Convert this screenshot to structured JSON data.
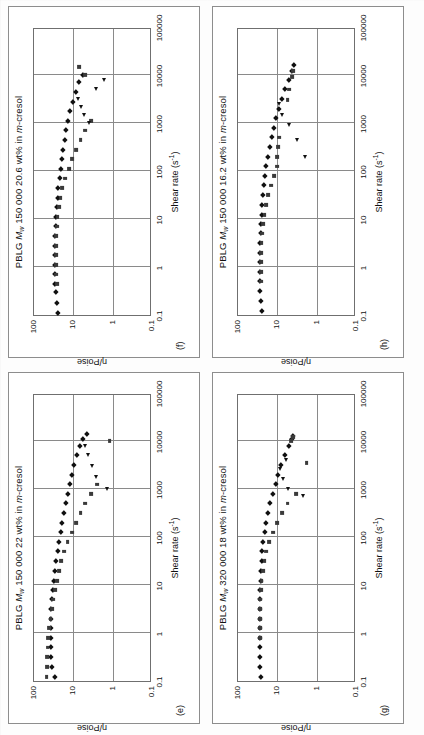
{
  "figure": {
    "axis_x_label": "Shear rate (s",
    "axis_x_label_sup": "-1",
    "axis_x_label_tail": ")",
    "axis_y_label": "η/Poise",
    "x_ticks": [
      "0.1",
      "1",
      "10",
      "100",
      "1000",
      "10000",
      "100000"
    ],
    "y_ticks": [
      "100",
      "10",
      "1",
      "0.1"
    ],
    "series_names": [
      "diamond",
      "square",
      "triangle"
    ],
    "marker_colors": {
      "diamond": "#101010",
      "square": "#3a3a3a",
      "triangle": "#111111"
    },
    "axis_color": "#6f6f6f",
    "grid_color": "#8a8a8a"
  },
  "chart_data": [
    {
      "type": "scatter",
      "panel_letter": "(e)",
      "title_prefix": "PBLG ",
      "title_m": "M",
      "title_m_sub": "w",
      "title_mid": " 150 000 22 wt% in ",
      "title_italic": "m",
      "title_tail": "-cresol",
      "title": "PBLG Mw 150 000 22 wt% in m-cresol",
      "xlabel": "Shear rate (s-1)",
      "ylabel": "η/Poise",
      "xlim": [
        0.1,
        100000
      ],
      "ylim": [
        0.1,
        100
      ],
      "xscale": "log",
      "yscale": "log",
      "grid": true,
      "series": [
        {
          "name": "diamond",
          "marker": "diamond",
          "x": [
            0.12,
            0.2,
            0.32,
            0.5,
            0.8,
            1.3,
            2.0,
            3.2,
            5.0,
            8.0,
            12,
            20,
            32,
            50,
            80,
            125,
            200,
            320,
            500,
            800,
            1250,
            2000,
            3200,
            5000,
            8000,
            11000,
            14000
          ],
          "y": [
            30,
            34,
            36,
            37,
            38,
            38,
            37,
            36,
            35,
            33,
            31,
            29,
            27,
            25,
            23,
            21,
            19,
            17,
            15.5,
            14,
            12.5,
            11,
            9.5,
            8.2,
            6.8,
            5.6,
            4.6
          ]
        },
        {
          "name": "square",
          "marker": "square",
          "x": [
            0.12,
            0.2,
            0.32,
            0.5,
            0.8,
            1.3,
            2.0,
            3.2,
            5.0,
            8.0,
            12,
            20,
            32,
            50,
            80,
            125,
            200,
            320,
            500,
            800,
            1250,
            10000
          ],
          "y": [
            48,
            47,
            46,
            45,
            43,
            41,
            38,
            35,
            32,
            29,
            26,
            23,
            20,
            17,
            14,
            11,
            8.5,
            6.5,
            5.0,
            3.6,
            2.5,
            1.2
          ]
        },
        {
          "name": "triangle",
          "marker": "triangle",
          "x": [
            1000,
            1800,
            3000,
            5000,
            8000
          ],
          "y": [
            1.4,
            2.6,
            3.4,
            4.2,
            5.0
          ]
        }
      ]
    },
    {
      "type": "scatter",
      "panel_letter": "(f)",
      "title_prefix": "PBLG ",
      "title_m": "M",
      "title_m_sub": "w",
      "title_mid": " 150 000 20.6 wt% in ",
      "title_italic": "m",
      "title_tail": "-cresol",
      "title": "PBLG Mw 150 000 20.6 wt% in m-cresol",
      "xlabel": "Shear rate (s-1)",
      "ylabel": "η/Poise",
      "xlim": [
        0.1,
        100000
      ],
      "ylim": [
        0.1,
        100
      ],
      "xscale": "log",
      "yscale": "log",
      "grid": true,
      "series": [
        {
          "name": "diamond",
          "marker": "diamond",
          "x": [
            0.11,
            0.18,
            0.3,
            0.45,
            0.7,
            1.1,
            1.8,
            2.8,
            4.5,
            7.0,
            11,
            18,
            28,
            45,
            70,
            110,
            180,
            280,
            450,
            700,
            1100,
            1800,
            2800,
            4500,
            7000,
            10000
          ],
          "y": [
            24,
            26,
            28,
            29,
            30,
            30,
            30,
            30,
            29,
            28,
            27,
            26,
            25,
            24,
            22,
            21,
            19.5,
            18,
            16.5,
            15,
            13.5,
            12,
            10,
            8.5,
            7,
            5.6
          ]
        },
        {
          "name": "square",
          "marker": "square",
          "x": [
            0.45,
            0.7,
            1.1,
            1.8,
            2.8,
            4.5,
            7.0,
            11,
            18,
            28,
            45,
            70,
            110,
            180,
            280,
            450,
            700,
            1100,
            10000,
            15000
          ],
          "y": [
            26,
            27,
            28,
            28,
            28,
            27,
            26,
            25,
            23,
            21,
            19,
            16,
            13,
            10.5,
            8.5,
            6.5,
            5.0,
            3.6,
            5.0,
            7.0
          ]
        },
        {
          "name": "triangle",
          "marker": "triangle",
          "x": [
            1000,
            1500,
            2200,
            3200,
            5000,
            8000
          ],
          "y": [
            4.0,
            5.5,
            6.5,
            7.5,
            2.6,
            1.7
          ]
        }
      ]
    },
    {
      "type": "scatter",
      "panel_letter": "(g)",
      "title_prefix": "PBLG ",
      "title_m": "M",
      "title_m_sub": "w",
      "title_mid": " 320 000 18 wt% in ",
      "title_italic": "m",
      "title_tail": "-cresol",
      "title": "PBLG Mw 320 000 18 wt% in m-cresol",
      "xlabel": "Shear rate (s-1)",
      "ylabel": "η/Poise",
      "xlim": [
        0.1,
        100000
      ],
      "ylim": [
        0.1,
        100
      ],
      "xscale": "log",
      "yscale": "log",
      "grid": true,
      "series": [
        {
          "name": "diamond",
          "marker": "diamond",
          "x": [
            0.12,
            0.2,
            0.32,
            0.5,
            0.8,
            1.3,
            2.0,
            3.2,
            5.0,
            8.0,
            12,
            20,
            32,
            50,
            80,
            125,
            200,
            320,
            500,
            800,
            1250,
            2000,
            3200,
            5000,
            8000,
            11000,
            13000
          ],
          "y": [
            26,
            27,
            28,
            28,
            28,
            28,
            28,
            28,
            27,
            27,
            26,
            26,
            25,
            24,
            23,
            21,
            19,
            17,
            15,
            13,
            11,
            9.5,
            8,
            6.5,
            5.2,
            4.3,
            4.0
          ]
        },
        {
          "name": "square",
          "marker": "square",
          "x": [
            0.8,
            1.3,
            2.0,
            3.2,
            5.0,
            8.0,
            12,
            20,
            32,
            50,
            80,
            125,
            200,
            320,
            500,
            800,
            3500,
            10000,
            12000
          ],
          "y": [
            28,
            28,
            28,
            28,
            27,
            26,
            25,
            23,
            21,
            19,
            16,
            13,
            10,
            7.5,
            5.5,
            3.4,
            1.8,
            4.4,
            4.0
          ]
        },
        {
          "name": "triangle",
          "marker": "triangle",
          "x": [
            700,
            1000,
            1600,
            2600,
            4000
          ],
          "y": [
            2.2,
            5.5,
            7.0,
            8.5,
            6.0
          ]
        }
      ]
    },
    {
      "type": "scatter",
      "panel_letter": "(h)",
      "title_prefix": "PBLG ",
      "title_m": "M",
      "title_m_sub": "w",
      "title_mid": " 150 000 16.2 wt% in ",
      "title_italic": "m",
      "title_tail": "-cresol",
      "title": "PBLG Mw 150 000 16.2 wt% in m-cresol",
      "xlabel": "Shear rate (s-1)",
      "ylabel": "η/Poise",
      "xlim": [
        0.1,
        100000
      ],
      "ylim": [
        0.1,
        100
      ],
      "xscale": "log",
      "yscale": "log",
      "grid": true,
      "series": [
        {
          "name": "diamond",
          "marker": "diamond",
          "x": [
            0.12,
            0.2,
            0.32,
            0.5,
            0.8,
            1.3,
            2.0,
            3.2,
            5.0,
            8.0,
            12,
            20,
            32,
            50,
            80,
            125,
            200,
            320,
            500,
            800,
            1250,
            2000,
            3200,
            5000,
            8000,
            12000,
            16000
          ],
          "y": [
            25,
            26,
            27,
            27,
            27,
            27,
            27,
            27,
            26,
            26,
            25,
            24,
            23,
            22,
            21,
            19,
            17,
            15.5,
            14,
            12,
            10.5,
            9,
            7.5,
            6.2,
            5.0,
            4.2,
            3.8
          ]
        },
        {
          "name": "square",
          "marker": "square",
          "x": [
            0.5,
            0.8,
            1.3,
            2.0,
            3.2,
            5.0,
            8.0,
            12,
            20,
            32,
            50,
            80,
            125,
            200,
            320,
            500,
            3000,
            5000,
            9000,
            12000
          ],
          "y": [
            26,
            26,
            26,
            26,
            25,
            24,
            23,
            21,
            19,
            17,
            14.5,
            12,
            10,
            10,
            9.5,
            9,
            5.5,
            5.0,
            4.2,
            4.0
          ]
        },
        {
          "name": "triangle",
          "marker": "triangle",
          "x": [
            200,
            450,
            900,
            1500,
            2500
          ],
          "y": [
            2.0,
            3.2,
            5.0,
            7.5,
            9.0
          ]
        }
      ]
    }
  ]
}
